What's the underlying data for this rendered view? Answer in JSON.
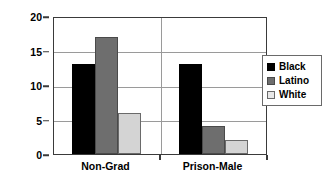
{
  "chart_data": {
    "type": "bar",
    "title": "",
    "xlabel": "",
    "ylabel": "",
    "categories": [
      "Non-Grad",
      "Prison-Male"
    ],
    "series": [
      {
        "name": "Black",
        "color": "#000000",
        "values": [
          13,
          13
        ]
      },
      {
        "name": "Latino",
        "color": "#6e6e6e",
        "values": [
          17,
          4
        ]
      },
      {
        "name": "White",
        "color": "#d4d4d4",
        "values": [
          6,
          2
        ]
      }
    ],
    "ylim": [
      0,
      20
    ],
    "yticks": [
      0,
      5,
      10,
      15,
      20
    ],
    "ytick_labels": [
      "0",
      "5",
      "10",
      "15",
      "20"
    ],
    "grid": true,
    "grid_axis": "y",
    "legend_position": "right",
    "legend_entries": [
      "Black",
      "Latino",
      "White"
    ]
  },
  "legend": {
    "items": [
      {
        "label": "Black",
        "swatch": "legend-swatch-black"
      },
      {
        "label": "Latino",
        "swatch": "legend-swatch-latino"
      },
      {
        "label": "White",
        "swatch": "legend-swatch-white"
      }
    ]
  },
  "colors": {
    "black": "#000000",
    "latino": "#6e6e6e",
    "white": "#d4d4d4",
    "axis": "#3a3a3a",
    "grid": "#9a9a9a",
    "background": "#ffffff"
  }
}
